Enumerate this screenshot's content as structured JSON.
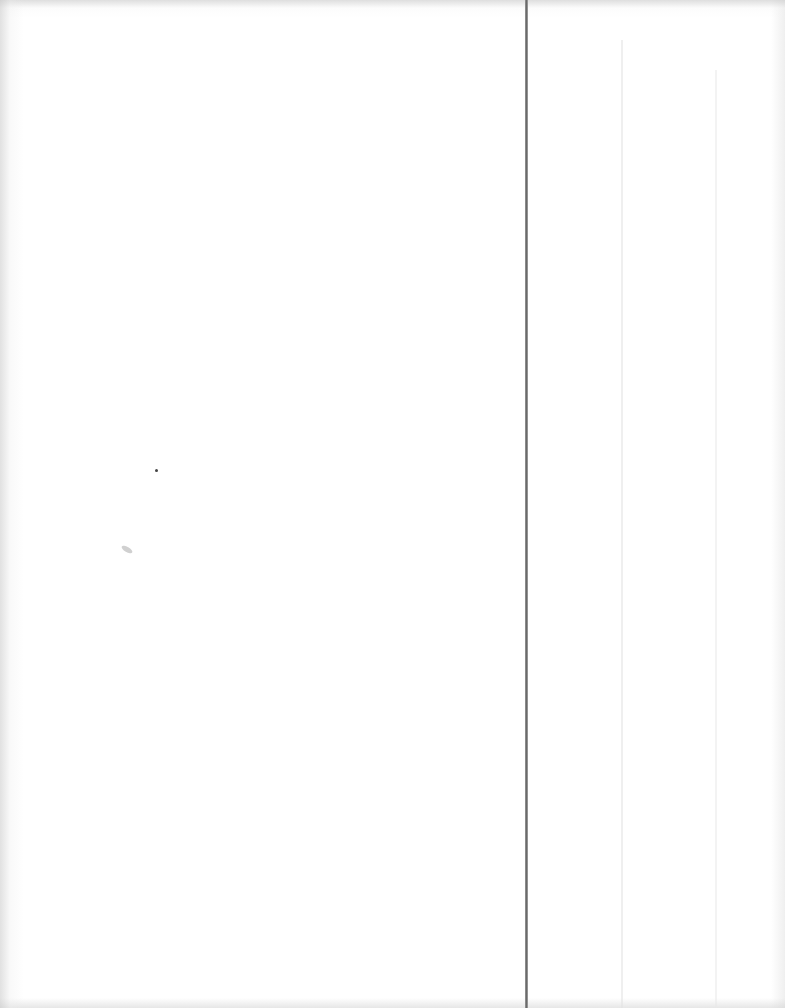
{
  "document": {
    "type": "blank scanned page",
    "text_content": "",
    "regions": [
      {
        "name": "left-column",
        "content": ""
      },
      {
        "name": "right-column",
        "content": ""
      }
    ]
  }
}
